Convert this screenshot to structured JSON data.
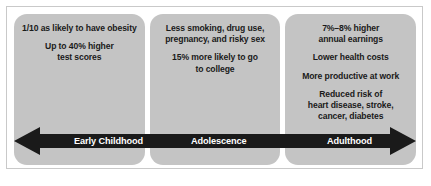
{
  "figure": {
    "panels": [
      {
        "id": "early-childhood",
        "stage_label": "Early Childhood",
        "lines": [
          "1/10 as likely to have obesity",
          "Up to 40% higher\ntest scores"
        ]
      },
      {
        "id": "adolescence",
        "stage_label": "Adolescence",
        "lines": [
          "Less smoking, drug use,\npregnancy, and risky sex",
          "15% more likely to go\nto college"
        ]
      },
      {
        "id": "adulthood",
        "stage_label": "Adulthood",
        "lines": [
          "7%–8% higher\nannual earnings",
          "Lower health costs",
          "More productive at work",
          "Reduced risk of\nheart disease, stroke,\ncancer, diabetes"
        ]
      }
    ],
    "timeline": {
      "left_arrowhead": "left-arrowhead-icon",
      "right_arrowhead": "right-arrowhead-icon",
      "labels": [
        "Early Childhood",
        "Adolescence",
        "Adulthood"
      ]
    },
    "caption": "",
    "colors": {
      "panel_fill": "#c4c4c4",
      "arrow_fill": "#1a1a1a",
      "frame_border": "#c9c9c9",
      "text": "#1a1a1a",
      "arrow_label_text": "#ffffff",
      "page_background": "#ffffff"
    }
  }
}
